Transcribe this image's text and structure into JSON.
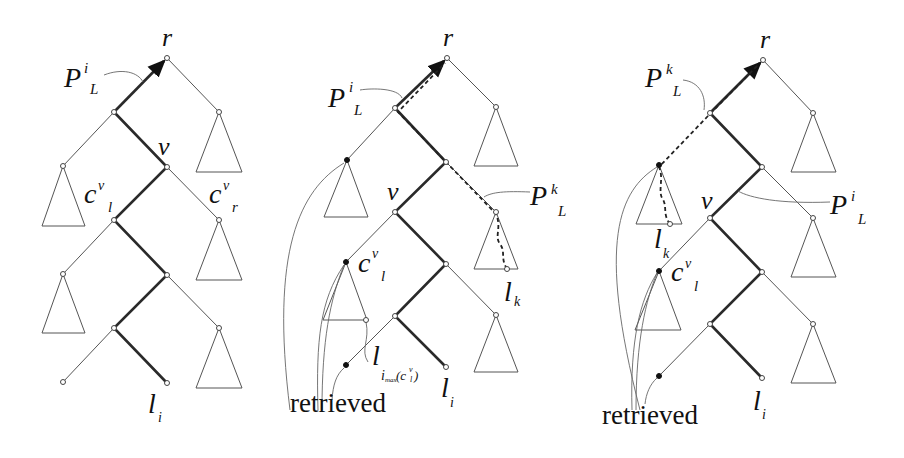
{
  "figure": {
    "panels": [
      {
        "id": "tree-1",
        "labels": {
          "root": "r",
          "path_main": "P",
          "path_sup": "i",
          "path_sub": "L",
          "v": "v",
          "cl_main": "c",
          "cl_sup": "v",
          "cl_sub": "l",
          "cr_main": "c",
          "cr_sup": "v",
          "cr_sub": "r",
          "leaf_main": "l",
          "leaf_sub": "i"
        }
      },
      {
        "id": "tree-2",
        "labels": {
          "root": "r",
          "pi_main": "P",
          "pi_sup": "i",
          "pi_sub": "L",
          "pk_main": "P",
          "pk_sup": "k",
          "pk_sub": "L",
          "v": "v",
          "cl_main": "c",
          "cl_sup": "v",
          "cl_sub": "l",
          "lk_main": "l",
          "lk_sub": "k",
          "limax_main": "l",
          "limax_sub": "i",
          "limax_subsub": "max",
          "limax_arg": "(c",
          "limax_arg_sup": "v",
          "limax_arg_sub": "l",
          "limax_close": ")",
          "leaf_main": "l",
          "leaf_sub": "i",
          "retrieved": "retrieved"
        }
      },
      {
        "id": "tree-3",
        "labels": {
          "root": "r",
          "pk_main": "P",
          "pk_sup": "k",
          "pk_sub": "L",
          "pi_main": "P",
          "pi_sup": "i",
          "pi_sub": "L",
          "v": "v",
          "cl_main": "c",
          "cl_sup": "v",
          "cl_sub": "l",
          "lk_main": "l",
          "lk_sub": "k",
          "leaf_main": "l",
          "leaf_sub": "i",
          "retrieved": "retrieved"
        }
      }
    ]
  }
}
